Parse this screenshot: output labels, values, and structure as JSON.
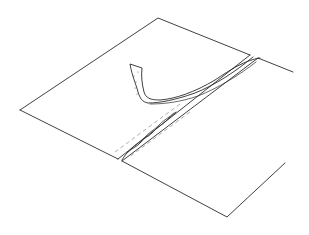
{
  "illustration": {
    "subject": "Line drawing of two fabric pieces joined by a pressed-open seam with a tape strip being applied along the seam",
    "colors": {
      "background": "#ffffff",
      "ink": "#2a2a2a",
      "dashed_stitch": "#8a8a8a"
    },
    "elements": [
      {
        "name": "fabric-panel-left",
        "description": "upper-left fabric piece"
      },
      {
        "name": "fabric-panel-right",
        "description": "lower-right fabric piece"
      },
      {
        "name": "seam-allowance",
        "description": "pressed open seam with wavy raw edge"
      },
      {
        "name": "stitch-lines",
        "description": "dashed stitching lines along both sides of seam"
      },
      {
        "name": "seam-tape",
        "description": "curled tape strip lifted from seam end"
      }
    ]
  }
}
